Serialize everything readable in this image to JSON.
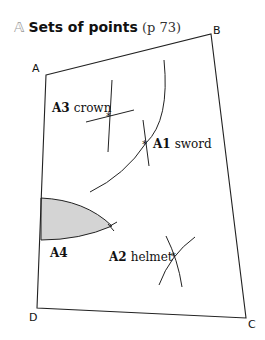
{
  "heading": {
    "icon": "𝔸",
    "icon_name": "double-struck-a-icon",
    "title": "Sets of points",
    "page_ref": "(p 73)"
  },
  "corners": {
    "a": "A",
    "b": "B",
    "c": "C",
    "d": "D"
  },
  "labels": {
    "a1": {
      "id": "A1",
      "text": "sword"
    },
    "a2": {
      "id": "A2",
      "text": "helmet"
    },
    "a3": {
      "id": "A3",
      "text": "crown"
    },
    "a4": {
      "id": "A4",
      "text": ""
    }
  },
  "colors": {
    "line": "#222222",
    "shade": "#d4d4d4",
    "icon": "#9a9a9a"
  }
}
